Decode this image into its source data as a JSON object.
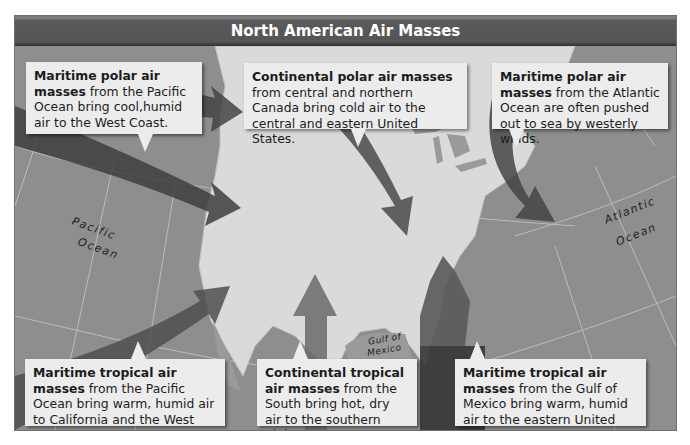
{
  "title": "North American Air Masses",
  "callouts": {
    "mp_pacific": {
      "bold": "Maritime polar air masses",
      "text": " from the Pacific Ocean bring cool,humid air to the West Coast."
    },
    "cp": {
      "bold": "Continental polar air masses",
      "text": " from central and northern Canada bring cold air to the central and eastern United States."
    },
    "mp_atlantic": {
      "bold": "Maritime polar air masses",
      "text": " from the Atlantic Ocean are often pushed out to sea by westerly winds."
    },
    "mt_pacific": {
      "bold": "Maritime tropical air masses",
      "text": " from the Pacific Ocean bring warm, humid air to California and the West Coast."
    },
    "ct": {
      "bold": "Continental tropical air masses",
      "text": " from the South bring hot, dry air to the southern plains."
    },
    "mt_gulf": {
      "bold": "Maritime tropical air masses",
      "text": " from the Gulf of Mexico bring warm, humid air to the eastern United States."
    }
  },
  "labels": {
    "pacific_1": "Pacific",
    "pacific_2": "Ocean",
    "atlantic_1": "Atlantic",
    "atlantic_2": "Ocean",
    "gulf_1": "Gulf of",
    "gulf_2": "Mexico"
  },
  "colors": {
    "ocean": "#8e8e8e",
    "land": "#dcdcdc",
    "title_bar": "#555555",
    "callout_bg": "#ececec",
    "arrow_polar": "#4a4a4a",
    "arrow_tropical": "#6a6a6a",
    "arrow_gulf": "#3a3a3a"
  }
}
